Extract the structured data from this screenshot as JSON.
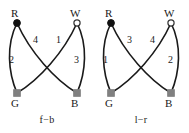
{
  "figure": {
    "background_color": "#ffffff",
    "edge_color": "#1a1a1a",
    "text_color": "#1a1a1a",
    "panels": [
      {
        "id": "f-b",
        "caption": "f−b",
        "nodes": [
          {
            "key": "R",
            "label": "R",
            "marker": "filled-circle",
            "color": "#111111",
            "x": 17,
            "y": 23
          },
          {
            "key": "W",
            "label": "W",
            "marker": "open-circle",
            "color": "#ffffff",
            "x": 77,
            "y": 23
          },
          {
            "key": "G",
            "label": "G",
            "marker": "filled-square",
            "color": "#808080",
            "x": 17,
            "y": 93
          },
          {
            "key": "B",
            "label": "B",
            "marker": "filled-square",
            "color": "#808080",
            "x": 77,
            "y": 93
          }
        ],
        "edges": [
          {
            "label": "4",
            "from": "R",
            "to": "B",
            "bow": "inward-right"
          },
          {
            "label": "1",
            "from": "W",
            "to": "G",
            "bow": "inward-left"
          },
          {
            "label": "2",
            "from": "R",
            "to": "G",
            "bow": "outward-left"
          },
          {
            "label": "3",
            "from": "W",
            "to": "B",
            "bow": "outward-right"
          }
        ]
      },
      {
        "id": "l-r",
        "caption": "l−r",
        "nodes": [
          {
            "key": "R",
            "label": "R",
            "marker": "filled-circle",
            "color": "#111111",
            "x": 17,
            "y": 23
          },
          {
            "key": "W",
            "label": "W",
            "marker": "open-circle",
            "color": "#ffffff",
            "x": 77,
            "y": 23
          },
          {
            "key": "G",
            "label": "G",
            "marker": "filled-square",
            "color": "#808080",
            "x": 17,
            "y": 93
          },
          {
            "key": "B",
            "label": "B",
            "marker": "filled-square",
            "color": "#808080",
            "x": 77,
            "y": 93
          }
        ],
        "edges": [
          {
            "label": "3",
            "from": "R",
            "to": "B",
            "bow": "inward-right"
          },
          {
            "label": "4",
            "from": "W",
            "to": "G",
            "bow": "inward-left"
          },
          {
            "label": "1",
            "from": "R",
            "to": "G",
            "bow": "outward-left"
          },
          {
            "label": "2",
            "from": "W",
            "to": "B",
            "bow": "outward-right"
          }
        ]
      }
    ]
  }
}
